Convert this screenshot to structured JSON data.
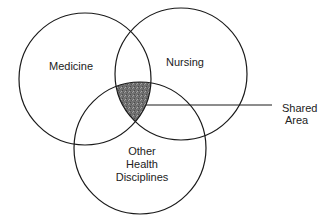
{
  "diagram": {
    "type": "venn",
    "sets": [
      {
        "id": "medicine",
        "label": "Medicine"
      },
      {
        "id": "nursing",
        "label": "Nursing"
      },
      {
        "id": "other",
        "label_lines": [
          "Other",
          "Health",
          "Disciplines"
        ]
      }
    ],
    "callout": {
      "label_lines": [
        "Shared",
        "Area"
      ]
    },
    "colors": {
      "stroke": "#1a1a1a",
      "shaded": "#6e6e6e",
      "background": "#ffffff"
    }
  }
}
